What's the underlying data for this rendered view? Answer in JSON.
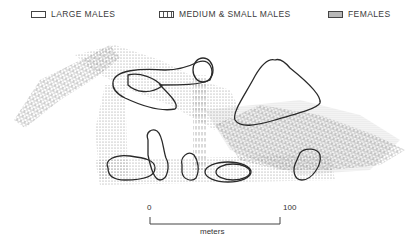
{
  "legend": {
    "items": [
      {
        "label": "LARGE MALES",
        "pattern": "outline"
      },
      {
        "label": "MEDIUM & SMALL MALES",
        "pattern": "vertical-dashes"
      },
      {
        "label": "FEMALES",
        "pattern": "stipple"
      }
    ]
  },
  "scale_bar": {
    "start_label": "0",
    "end_label": "100",
    "unit_label": "meters"
  },
  "colors": {
    "outline": "#2a2a2a",
    "stipple": "#9a9a9a",
    "background": "#ffffff"
  }
}
